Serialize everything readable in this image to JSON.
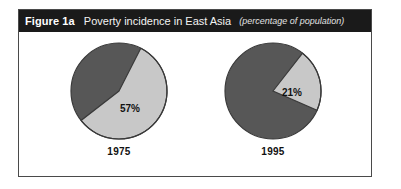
{
  "figure": {
    "label": "Figure 1a",
    "title": "Poverty incidence in East Asia",
    "subtitle": "(percentage of population)"
  },
  "colors": {
    "frame": "#4a4a4a",
    "title_bar": "#1a1a1a",
    "title_text": "#ffffff",
    "slice_dark": "#575757",
    "slice_light": "#c8c8c8",
    "slice_outline": "#3a3a3a",
    "label_text": "#111111",
    "background": "#ffffff"
  },
  "chart_data": {
    "type": "pie",
    "title": "Poverty incidence in East Asia",
    "subtitle": "(percentage of population)",
    "unit": "percentage of population",
    "grid": false,
    "legend": "none",
    "charts": [
      {
        "name": "1975",
        "year_label": "1975",
        "categories": [
          "Poor",
          "Non-poor"
        ],
        "values": [
          57,
          43
        ],
        "labels": [
          "57%",
          ""
        ],
        "shown_label": "57%",
        "shown_value": 57,
        "colors": [
          "#c8c8c8",
          "#575757"
        ],
        "start_angle_deg": 27
      },
      {
        "name": "1995",
        "year_label": "1995",
        "categories": [
          "Poor",
          "Non-poor"
        ],
        "values": [
          21,
          79
        ],
        "labels": [
          "21%",
          ""
        ],
        "shown_label": "21%",
        "shown_value": 21,
        "colors": [
          "#c8c8c8",
          "#575757"
        ],
        "start_angle_deg": 38
      }
    ]
  }
}
